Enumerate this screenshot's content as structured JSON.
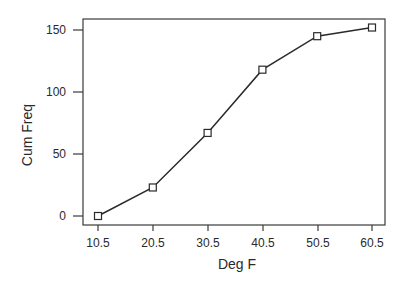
{
  "chart_data": {
    "type": "line",
    "title": "",
    "xlabel": "Deg F",
    "ylabel": "Cum Freq",
    "categories": [
      "10.5",
      "20.5",
      "30.5",
      "40.5",
      "50.5",
      "60.5"
    ],
    "x": [
      10.5,
      20.5,
      30.5,
      40.5,
      50.5,
      60.5
    ],
    "values": [
      0,
      23,
      67,
      118,
      145,
      152
    ],
    "series": [
      {
        "name": "Cum Freq",
        "marker": "square",
        "values": [
          0,
          23,
          67,
          118,
          145,
          152
        ]
      }
    ],
    "yticks": [
      "0",
      "50",
      "100",
      "150"
    ],
    "xticks": [
      "10.5",
      "20.5",
      "30.5",
      "40.5",
      "50.5",
      "60.5"
    ],
    "ylim": [
      0,
      150
    ],
    "grid": false,
    "legend": "none"
  },
  "colors": {
    "line": "#2a2a2a",
    "background": "#ffffff"
  }
}
